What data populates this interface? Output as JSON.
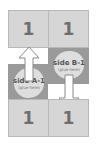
{
  "diagram": {
    "top_row": [
      {
        "label": "1"
      },
      {
        "label": "1"
      }
    ],
    "bottom_row": [
      {
        "label": "1"
      },
      {
        "label": "1"
      }
    ],
    "side_a": {
      "title": "side A-1",
      "note": "(glue here)",
      "arrow": "up"
    },
    "side_b": {
      "title": "side B-1",
      "note": "(glue here)",
      "arrow": "down"
    },
    "colors": {
      "panel": "#d6d6d6",
      "glue_area": "#9a9a9a",
      "blob": "#dedede",
      "number": "#6e6e6e"
    }
  }
}
